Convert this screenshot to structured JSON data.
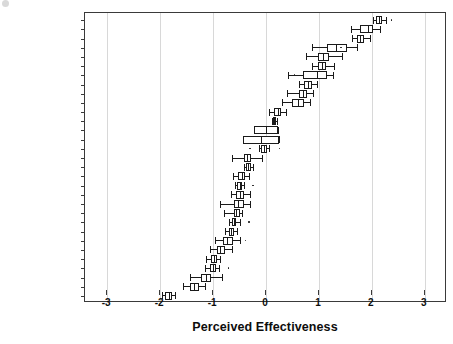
{
  "chart_data": {
    "type": "boxplot",
    "title": "",
    "xlabel": "Perceived Effectiveness",
    "ylabel": "",
    "xlim": [
      -3.42,
      3.42
    ],
    "xticks": [
      -3,
      -2,
      -1,
      0,
      1,
      2,
      3
    ],
    "xticklabels": [
      "-3",
      "-2",
      "-1",
      "0",
      "1",
      "2",
      "3"
    ],
    "grid": "vertical",
    "legend": "none",
    "orientation": "horizontal",
    "categories": [
      "SINGAPORE",
      "NEW ZEALAND",
      "AUSTRALIA",
      "HONG KONG",
      "TAIWAN",
      "JAPAN",
      "MACAO",
      "KOREA, SOUTH",
      "MALAYSIA",
      "BRUNEI",
      "THAILAND",
      "GUAM",
      "AMERICAN SAMOA",
      "NEW CALEDONIA",
      "CHINA",
      "FIJI",
      "PHILIPPINES",
      "MONGOLIA",
      "VIETNAM",
      "KIRIBATI",
      "VANUATU",
      "INDONESIA",
      "TONGA",
      "MICRONESIA",
      "PAPUA NEW GUINEA",
      "CAMBODIA",
      "LAOS",
      "MARSHALL ISLANDS",
      "SOLOMON ISLANDS",
      "MYANMAR",
      "KOREA, NORTH"
    ],
    "boxes": [
      {
        "label": "SINGAPORE",
        "whisker_low": 2.02,
        "q1": 2.08,
        "median": 2.14,
        "q3": 2.2,
        "whisker_high": 2.26,
        "outliers": [
          2.36
        ]
      },
      {
        "label": "NEW ZEALAND",
        "whisker_low": 1.6,
        "q1": 1.78,
        "median": 1.92,
        "q3": 2.02,
        "whisker_high": 2.16,
        "outliers": []
      },
      {
        "label": "AUSTRALIA",
        "whisker_low": 1.62,
        "q1": 1.72,
        "median": 1.78,
        "q3": 1.86,
        "whisker_high": 1.96,
        "outliers": []
      },
      {
        "label": "HONG KONG",
        "whisker_low": 0.86,
        "q1": 1.16,
        "median": 1.32,
        "q3": 1.54,
        "whisker_high": 1.72,
        "outliers": [
          1.4
        ]
      },
      {
        "label": "TAIWAN",
        "whisker_low": 0.76,
        "q1": 0.98,
        "median": 1.08,
        "q3": 1.2,
        "whisker_high": 1.44,
        "outliers": []
      },
      {
        "label": "JAPAN",
        "whisker_low": 0.86,
        "q1": 0.98,
        "median": 1.06,
        "q3": 1.14,
        "whisker_high": 1.28,
        "outliers": []
      },
      {
        "label": "MACAO",
        "whisker_low": 0.42,
        "q1": 0.7,
        "median": 0.96,
        "q3": 1.16,
        "whisker_high": 1.26,
        "outliers": [
          0.52
        ]
      },
      {
        "label": "KOREA, SOUTH",
        "whisker_low": 0.62,
        "q1": 0.72,
        "median": 0.8,
        "q3": 0.86,
        "whisker_high": 0.96,
        "outliers": []
      },
      {
        "label": "MALAYSIA",
        "whisker_low": 0.4,
        "q1": 0.62,
        "median": 0.7,
        "q3": 0.78,
        "whisker_high": 0.88,
        "outliers": []
      },
      {
        "label": "BRUNEI",
        "whisker_low": 0.3,
        "q1": 0.5,
        "median": 0.6,
        "q3": 0.72,
        "whisker_high": 0.84,
        "outliers": []
      },
      {
        "label": "THAILAND",
        "whisker_low": 0.06,
        "q1": 0.16,
        "median": 0.22,
        "q3": 0.28,
        "whisker_high": 0.38,
        "outliers": []
      },
      {
        "label": "GUAM",
        "whisker_low": 0.12,
        "q1": 0.14,
        "median": 0.16,
        "q3": 0.18,
        "whisker_high": 0.2,
        "outliers": []
      },
      {
        "label": "AMERICAN SAMOA",
        "whisker_low": -0.22,
        "q1": -0.22,
        "median": 0.0,
        "q3": 0.22,
        "whisker_high": 0.22,
        "outliers": []
      },
      {
        "label": "NEW CALEDONIA",
        "whisker_low": -0.44,
        "q1": -0.44,
        "median": -0.1,
        "q3": 0.24,
        "whisker_high": 0.24,
        "outliers": []
      },
      {
        "label": "CHINA",
        "whisker_low": -0.14,
        "q1": -0.1,
        "median": -0.04,
        "q3": 0.02,
        "whisker_high": 0.06,
        "outliers": [
          -0.32,
          0.24
        ]
      },
      {
        "label": "FIJI",
        "whisker_low": -0.64,
        "q1": -0.42,
        "median": -0.36,
        "q3": -0.28,
        "whisker_high": -0.08,
        "outliers": []
      },
      {
        "label": "PHILIPPINES",
        "whisker_low": -0.42,
        "q1": -0.38,
        "median": -0.34,
        "q3": -0.28,
        "whisker_high": -0.24,
        "outliers": []
      },
      {
        "label": "MONGOLIA",
        "whisker_low": -0.62,
        "q1": -0.52,
        "median": -0.46,
        "q3": -0.4,
        "whisker_high": -0.32,
        "outliers": []
      },
      {
        "label": "VIETNAM",
        "whisker_low": -0.58,
        "q1": -0.54,
        "median": -0.5,
        "q3": -0.46,
        "whisker_high": -0.42,
        "outliers": [
          -0.26
        ]
      },
      {
        "label": "KIRIBATI",
        "whisker_low": -0.66,
        "q1": -0.56,
        "median": -0.5,
        "q3": -0.42,
        "whisker_high": -0.3,
        "outliers": []
      },
      {
        "label": "VANUATU",
        "whisker_low": -0.86,
        "q1": -0.6,
        "median": -0.52,
        "q3": -0.42,
        "whisker_high": -0.3,
        "outliers": []
      },
      {
        "label": "INDONESIA",
        "whisker_low": -0.8,
        "q1": -0.6,
        "median": -0.56,
        "q3": -0.5,
        "whisker_high": -0.46,
        "outliers": []
      },
      {
        "label": "TONGA",
        "whisker_low": -0.7,
        "q1": -0.64,
        "median": -0.6,
        "q3": -0.56,
        "whisker_high": -0.5,
        "outliers": [
          -0.34
        ]
      },
      {
        "label": "MICRONESIA",
        "whisker_low": -0.78,
        "q1": -0.7,
        "median": -0.66,
        "q3": -0.6,
        "whisker_high": -0.54,
        "outliers": []
      },
      {
        "label": "PAPUA NEW GUINEA",
        "whisker_low": -0.96,
        "q1": -0.82,
        "median": -0.74,
        "q3": -0.62,
        "whisker_high": -0.5,
        "outliers": [
          -0.4
        ]
      },
      {
        "label": "CAMBODIA",
        "whisker_low": -1.06,
        "q1": -0.92,
        "median": -0.86,
        "q3": -0.78,
        "whisker_high": -0.64,
        "outliers": []
      },
      {
        "label": "LAOS",
        "whisker_low": -1.14,
        "q1": -1.04,
        "median": -0.98,
        "q3": -0.92,
        "whisker_high": -0.86,
        "outliers": []
      },
      {
        "label": "MARSHALL ISLANDS",
        "whisker_low": -1.16,
        "q1": -1.06,
        "median": -1.0,
        "q3": -0.94,
        "whisker_high": -0.88,
        "outliers": [
          -0.72
        ]
      },
      {
        "label": "SOLOMON ISLANDS",
        "whisker_low": -1.44,
        "q1": -1.22,
        "median": -1.14,
        "q3": -1.04,
        "whisker_high": -0.84,
        "outliers": []
      },
      {
        "label": "MYANMAR",
        "whisker_low": -1.56,
        "q1": -1.44,
        "median": -1.36,
        "q3": -1.26,
        "whisker_high": -1.16,
        "outliers": []
      },
      {
        "label": "KOREA, NORTH",
        "whisker_low": -1.96,
        "q1": -1.9,
        "median": -1.84,
        "q3": -1.78,
        "whisker_high": -1.72,
        "outliers": []
      }
    ]
  }
}
